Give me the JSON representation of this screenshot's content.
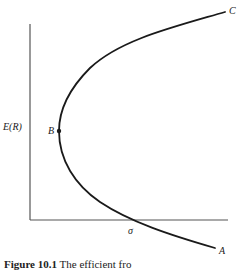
{
  "figure": {
    "y_axis_label": "E(R)",
    "x_axis_label": "σ",
    "point_labels": {
      "A": "A",
      "B": "B",
      "C": "C"
    },
    "caption_prefix": "Figure 10.1",
    "caption_text": "The efficient fro",
    "colors": {
      "curve": "#1a1a1a",
      "axis": "#555555",
      "background": "#ffffff"
    }
  }
}
